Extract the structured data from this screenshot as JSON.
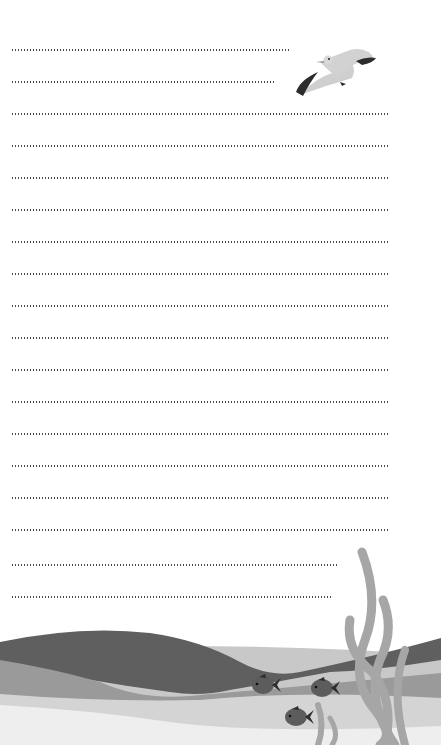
{
  "page": {
    "type": "lined writing paper",
    "line_count": 18,
    "line_color": "#4a4a4a"
  },
  "lines": [
    {
      "top": 49,
      "width": 280
    },
    {
      "top": 81,
      "width": 265
    },
    {
      "top": 113,
      "width": 378
    },
    {
      "top": 145,
      "width": 378
    },
    {
      "top": 177,
      "width": 378
    },
    {
      "top": 209,
      "width": 378
    },
    {
      "top": 241,
      "width": 378
    },
    {
      "top": 273,
      "width": 378
    },
    {
      "top": 305,
      "width": 378
    },
    {
      "top": 337,
      "width": 378
    },
    {
      "top": 369,
      "width": 378
    },
    {
      "top": 401,
      "width": 378
    },
    {
      "top": 433,
      "width": 378
    },
    {
      "top": 465,
      "width": 378
    },
    {
      "top": 497,
      "width": 378
    },
    {
      "top": 529,
      "width": 378
    },
    {
      "top": 564,
      "width": 327
    },
    {
      "top": 596,
      "width": 322
    }
  ],
  "decorations": {
    "seagull": {
      "icon": "seagull-icon"
    },
    "waves": {
      "colors": [
        "#5f5f5f",
        "#9a9a9a",
        "#c8c8c8",
        "#e2e2e2",
        "#f0f0f0"
      ]
    },
    "fish": [
      {
        "icon": "fish-icon",
        "x": 263,
        "y": 685
      },
      {
        "icon": "fish-icon",
        "x": 322,
        "y": 688
      },
      {
        "icon": "fish-icon",
        "x": 296,
        "y": 717
      }
    ],
    "seaweed": {
      "icon": "seaweed-icon",
      "color": "#a6a6a6"
    }
  }
}
